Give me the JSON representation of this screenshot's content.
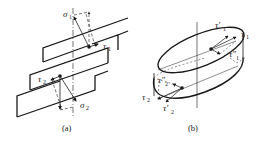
{
  "figure": {
    "panel_a": {
      "caption": "(a)",
      "labels": {
        "sigma1": "σ",
        "sigma1_sub": "1",
        "tau1": "τ",
        "tau1_sub": "1",
        "tau2": "τ",
        "tau2_sub": "2",
        "sigma2": "σ",
        "sigma2_sub": "2"
      }
    },
    "panel_b": {
      "caption": "(b)",
      "labels": {
        "tau1_prime": "τ′",
        "tau1_prime_sub": "1",
        "tau1": "τ",
        "tau1_sub": "1",
        "tau1_dprime": "τ″",
        "tau1_dprime_sub": "1",
        "tau2_dprime": "τ″",
        "tau2_dprime_sub": "2",
        "tau2": "τ",
        "tau2_sub": "2",
        "tau2_prime": "τ′",
        "tau2_prime_sub": "2"
      }
    },
    "colors": {
      "line": "#1a1a1a",
      "text": "#222222",
      "background": "#ffffff"
    }
  }
}
